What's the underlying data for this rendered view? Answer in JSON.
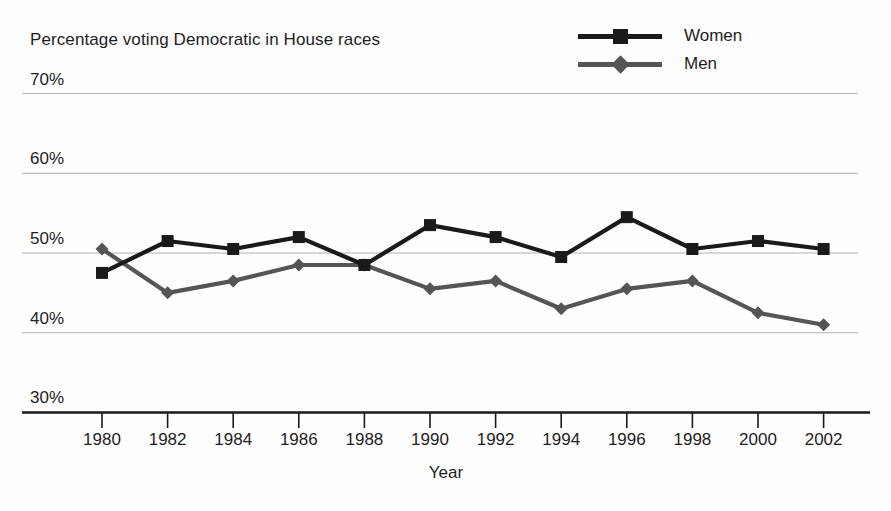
{
  "chart_data": {
    "type": "line",
    "title": "Percentage voting Democratic in House races",
    "subtitle": "",
    "xlabel": "Year",
    "ylabel": "",
    "categories": [
      "1980",
      "1982",
      "1984",
      "1986",
      "1988",
      "1990",
      "1992",
      "1994",
      "1996",
      "1998",
      "2000",
      "2002"
    ],
    "series": [
      {
        "name": "Women",
        "marker": "square",
        "color": "#1a1a1a",
        "values": [
          47.5,
          51.5,
          50.5,
          52.0,
          48.5,
          53.5,
          52.0,
          49.5,
          54.5,
          50.5,
          51.5,
          50.5
        ]
      },
      {
        "name": "Men",
        "marker": "diamond",
        "color": "#555555",
        "values": [
          50.5,
          45.0,
          46.5,
          48.5,
          48.5,
          45.5,
          46.5,
          43.0,
          45.5,
          46.5,
          42.5,
          41.0
        ]
      }
    ],
    "ylim": [
      30,
      70
    ],
    "yticks": [
      30,
      40,
      50,
      60,
      70
    ],
    "ytick_labels": [
      "30%",
      "40%",
      "50%",
      "60%",
      "70%"
    ],
    "grid": true,
    "legend_position": "top-right"
  },
  "colors": {
    "women": "#1a1a1a",
    "men": "#555555",
    "gridline": "#b0b0b0",
    "axis": "#1a1a1a",
    "text": "#1d1d1d",
    "background": "#fefefe"
  },
  "legend": {
    "items": [
      {
        "label": "Women"
      },
      {
        "label": "Men"
      }
    ]
  },
  "axis": {
    "x_title": "Year"
  }
}
